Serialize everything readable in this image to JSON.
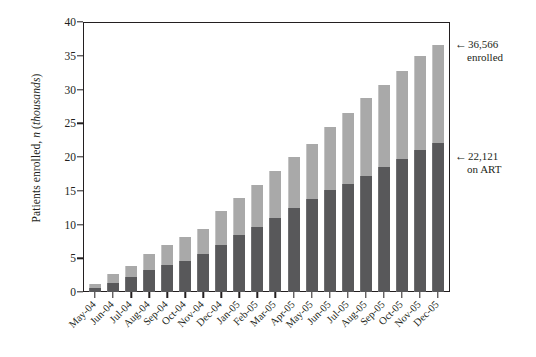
{
  "chart_data": {
    "type": "bar",
    "subtype": "stacked",
    "title": "",
    "xlabel": "",
    "ylabel": "Patients enrolled, n (thousands)",
    "ylabel_parts": {
      "plain1": "Patients enrolled, ",
      "italic1": "n",
      "plain2": " (",
      "italic2": "thousands",
      "plain3": ")"
    },
    "ylim": [
      0,
      40
    ],
    "yticks": [
      0,
      5,
      10,
      15,
      20,
      25,
      30,
      35,
      40
    ],
    "ytick_labels": [
      "0",
      "5",
      "10",
      "15",
      "20",
      "25",
      "30",
      "35",
      "40"
    ],
    "grid": false,
    "legend_position": "none",
    "categories": [
      "May-04",
      "Jun-04",
      "Jul-04",
      "Aug-04",
      "Sep-04",
      "Oct-04",
      "Nov-04",
      "Dec-04",
      "Jan-05",
      "Feb-05",
      "Mar-05",
      "Apr-05",
      "May-05",
      "Jun-05",
      "Jul-05",
      "Aug-05",
      "Sep-05",
      "Oct-05",
      "Nov-05",
      "Dec-05"
    ],
    "series": [
      {
        "name": "on ART",
        "color": "#58585a",
        "stack_position": "bottom",
        "values": [
          0.6,
          1.3,
          2.2,
          3.2,
          4.0,
          4.6,
          5.6,
          7.0,
          8.5,
          9.7,
          10.9,
          12.4,
          13.8,
          15.1,
          16.0,
          17.2,
          18.5,
          19.7,
          21.0,
          22.1
        ]
      },
      {
        "name": "enrolled, not on ART",
        "color": "#a9a9a9",
        "stack_position": "top",
        "values": [
          0.6,
          1.4,
          1.6,
          2.4,
          2.9,
          3.5,
          3.8,
          5.0,
          5.4,
          6.2,
          7.1,
          7.6,
          8.2,
          9.4,
          10.5,
          11.6,
          12.2,
          13.0,
          13.9,
          14.5
        ]
      }
    ],
    "totals": [
      1.2,
      2.7,
      3.8,
      5.6,
      6.9,
      8.1,
      9.4,
      12.0,
      13.9,
      15.9,
      18.0,
      20.0,
      22.0,
      24.5,
      26.5,
      28.8,
      30.7,
      32.7,
      34.9,
      36.6
    ],
    "annotations": [
      {
        "id": "enrolled",
        "arrow": "←",
        "line1": "36,566",
        "line2": "enrolled",
        "target_value": 36.566,
        "target_category": "Dec-05"
      },
      {
        "id": "on-art",
        "arrow": "←",
        "line1": "22,121",
        "line2": "on ART",
        "target_value": 22.121,
        "target_category": "Dec-05"
      }
    ],
    "colors": {
      "series_top": "#a9a9a9",
      "series_bottom": "#58585a",
      "axis": "#231f20",
      "background": "#ffffff"
    }
  }
}
